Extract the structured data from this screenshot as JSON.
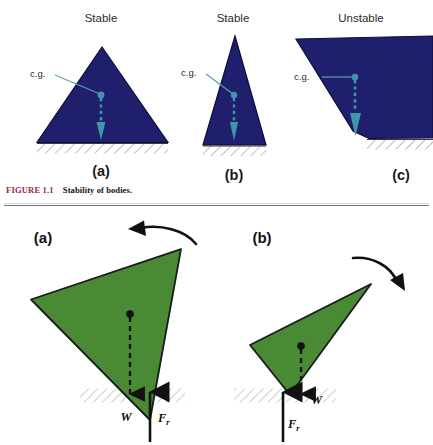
{
  "figure": {
    "number": "FIGURE 1.1",
    "caption": "Stability of bodies.",
    "accent_color": "#9c2743"
  },
  "colors": {
    "body_navy": "#1f1f6e",
    "body_navy_dark": "#121250",
    "body_green": "#4a8a35",
    "cg_teal": "#3f96a6",
    "outline_black": "#111111",
    "hatch_gray": "#b9b9b9"
  },
  "top_panels": [
    {
      "id": "a",
      "state_label": "Stable",
      "panel_label": "(a)",
      "cg_label": "c.g.",
      "shape": "wide-triangle",
      "shape_fill": "#1f1f6e"
    },
    {
      "id": "b",
      "state_label": "Stable",
      "panel_label": "(b)",
      "cg_label": "c.g.",
      "shape": "narrow-triangle",
      "shape_fill": "#1f1f6e"
    },
    {
      "id": "c",
      "state_label": "Unstable",
      "panel_label": "(c)",
      "cg_label": "c.g.",
      "shape": "tipped-wedge",
      "shape_fill": "#1f1f6e"
    }
  ],
  "bottom_panels": [
    {
      "id": "a",
      "panel_label": "(a)",
      "shape": "large-tipped-triangle",
      "shape_fill": "#4a8a35",
      "weight_label": "W",
      "reaction_label": "F",
      "reaction_sub": "r",
      "rotation_icon": "curved-arrow-counterclockwise"
    },
    {
      "id": "b",
      "panel_label": "(b)",
      "shape": "slender-tipped-triangle",
      "shape_fill": "#4a8a35",
      "weight_label": "W",
      "reaction_label": "F",
      "reaction_sub": "r",
      "rotation_icon": "curved-arrow-clockwise"
    }
  ]
}
